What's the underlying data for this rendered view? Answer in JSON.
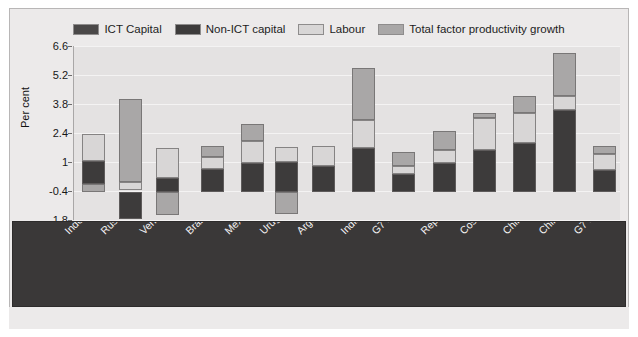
{
  "legend": {
    "items": [
      {
        "label": "ICT Capital",
        "color": "#4a4848",
        "icon": "legend-swatch-ict-capital"
      },
      {
        "label": "Non-ICT capital",
        "color": "#3d3b3b",
        "icon": "legend-swatch-non-ict-capital"
      },
      {
        "label": "Labour",
        "color": "#d8d6d6",
        "icon": "legend-swatch-labour"
      },
      {
        "label": "Total factor productivity growth",
        "color": "#a9a7a7",
        "icon": "legend-swatch-tfp"
      }
    ]
  },
  "axis": {
    "y_title": "Per cent",
    "y_ticks": [
      "6.6",
      "5.2",
      "3.8",
      "2.4",
      "1",
      "-0.4",
      "-1.8"
    ]
  },
  "chart_data": {
    "type": "bar",
    "title": "",
    "subtitle": "",
    "xlabel": "",
    "ylabel": "Per cent",
    "ylim": [
      -1.8,
      6.6
    ],
    "ytick_values": [
      6.6,
      5.2,
      3.8,
      2.4,
      1.0,
      -0.4,
      -1.8
    ],
    "grid": true,
    "stacked": true,
    "legend_position": "top-center",
    "categories": [
      "Indonesia a,I",
      "Russian Federation a,I",
      "Venezuela c,IV",
      "Brazil b,II",
      "Mexico a,I",
      "Uruguay b,II",
      "Argentina b,III",
      "India a,I",
      "G7 average (1989-1995) a",
      "Rep of Korea a,I",
      "Costa Rica b,IV",
      "Chile b,IV",
      "China  a,I",
      "G7 average (1999-2003) a"
    ],
    "series": [
      {
        "name": "ICT Capital",
        "color": "#4a4848",
        "values": [
          0.15,
          0.15,
          0.1,
          0.15,
          0.2,
          0.15,
          0.15,
          0.2,
          0.35,
          0.55,
          0.35,
          0.4,
          0.3,
          0.3
        ]
      },
      {
        "name": "Non-ICT capital",
        "color": "#3d3b3b",
        "values": [
          1.2,
          -1.45,
          0.35,
          1.05,
          1.3,
          1.45,
          1.2,
          2.1,
          0.85,
          1.6,
          1.9,
          2.25,
          3.6,
          0.85
        ]
      },
      {
        "name": "Labour",
        "color": "#d8d6d6",
        "values": [
          1.4,
          0.35,
          1.85,
          0.6,
          1.15,
          0.5,
          0.55,
          1.45,
          0.4,
          0.7,
          1.75,
          1.6,
          0.75,
          0.9
        ]
      },
      {
        "name": "Total factor productivity growth",
        "color": "#a9a7a7",
        "values": [
          -0.65,
          3.95,
          -1.95,
          0.6,
          0.05,
          -1.3,
          0.0,
          2.75,
          0.75,
          1.0,
          0.65,
          0.9,
          2.35,
          0.45
        ]
      }
    ]
  },
  "bars": [
    {
      "name": "Indonesia a,I",
      "x": 81,
      "width": 23,
      "segments": [
        {
          "series": "Total factor productivity growth",
          "top": 184,
          "bottom": 192,
          "color": "#a9a7a7"
        },
        {
          "series": "Non-ICT capital",
          "top": 161,
          "bottom": 184,
          "color": "#3d3b3b"
        },
        {
          "series": "Labour",
          "top": 134,
          "bottom": 161,
          "color": "#d8d6d6"
        }
      ]
    },
    {
      "name": "Russian Federation a,I",
      "x": 118,
      "width": 23,
      "segments": [
        {
          "series": "Non-ICT capital",
          "top": 192,
          "bottom": 219,
          "color": "#3d3b3b"
        },
        {
          "series": "Labour",
          "top": 182,
          "bottom": 190,
          "color": "#d8d6d6"
        },
        {
          "series": "Total factor productivity growth",
          "top": 99,
          "bottom": 182,
          "color": "#a9a7a7"
        }
      ]
    },
    {
      "name": "Venezuela c,IV",
      "x": 155,
      "width": 23,
      "segments": [
        {
          "series": "Total factor productivity growth",
          "top": 192,
          "bottom": 215,
          "color": "#a9a7a7"
        },
        {
          "series": "Non-ICT capital",
          "top": 178,
          "bottom": 192,
          "color": "#3d3b3b"
        },
        {
          "series": "Labour",
          "top": 148,
          "bottom": 178,
          "color": "#d8d6d6"
        }
      ]
    },
    {
      "name": "Brazil b,II",
      "x": 200,
      "width": 23,
      "segments": [
        {
          "series": "Non-ICT capital",
          "top": 169,
          "bottom": 192,
          "color": "#3d3b3b"
        },
        {
          "series": "Labour",
          "top": 157,
          "bottom": 169,
          "color": "#d8d6d6"
        },
        {
          "series": "Total factor productivity growth",
          "top": 146,
          "bottom": 157,
          "color": "#a9a7a7"
        }
      ]
    },
    {
      "name": "Mexico a,I",
      "x": 240,
      "width": 23,
      "segments": [
        {
          "series": "Non-ICT capital",
          "top": 163,
          "bottom": 192,
          "color": "#3d3b3b"
        },
        {
          "series": "Labour",
          "top": 141,
          "bottom": 163,
          "color": "#d8d6d6"
        },
        {
          "series": "Total factor productivity growth",
          "top": 124,
          "bottom": 141,
          "color": "#a9a7a7"
        }
      ]
    },
    {
      "name": "Uruguay b,II",
      "x": 274,
      "width": 23,
      "segments": [
        {
          "series": "Total factor productivity growth",
          "top": 192,
          "bottom": 214,
          "color": "#a9a7a7"
        },
        {
          "series": "Non-ICT capital",
          "top": 162,
          "bottom": 192,
          "color": "#3d3b3b"
        },
        {
          "series": "Labour",
          "top": 147,
          "bottom": 162,
          "color": "#d8d6d6"
        }
      ]
    },
    {
      "name": "Argentina b,III",
      "x": 311,
      "width": 23,
      "segments": [
        {
          "series": "Non-ICT capital",
          "top": 166,
          "bottom": 192,
          "color": "#3d3b3b"
        },
        {
          "series": "Labour",
          "top": 146,
          "bottom": 166,
          "color": "#d8d6d6"
        }
      ]
    },
    {
      "name": "India a,I",
      "x": 351,
      "width": 23,
      "segments": [
        {
          "series": "Non-ICT capital",
          "top": 148,
          "bottom": 192,
          "color": "#3d3b3b"
        },
        {
          "series": "Labour",
          "top": 120,
          "bottom": 148,
          "color": "#d8d6d6"
        },
        {
          "series": "Total factor productivity growth",
          "top": 68,
          "bottom": 120,
          "color": "#a9a7a7"
        }
      ]
    },
    {
      "name": "G7 average (1989-1995) a",
      "x": 391,
      "width": 23,
      "segments": [
        {
          "series": "Non-ICT capital",
          "top": 174,
          "bottom": 192,
          "color": "#3d3b3b"
        },
        {
          "series": "Labour",
          "top": 166,
          "bottom": 174,
          "color": "#d8d6d6"
        },
        {
          "series": "Total factor productivity growth",
          "top": 152,
          "bottom": 166,
          "color": "#a9a7a7"
        }
      ]
    },
    {
      "name": "Rep of Korea a,I",
      "x": 432,
      "width": 23,
      "segments": [
        {
          "series": "Non-ICT capital",
          "top": 163,
          "bottom": 192,
          "color": "#3d3b3b"
        },
        {
          "series": "Labour",
          "top": 150,
          "bottom": 163,
          "color": "#d8d6d6"
        },
        {
          "series": "Total factor productivity growth",
          "top": 131,
          "bottom": 150,
          "color": "#a9a7a7"
        }
      ]
    },
    {
      "name": "Costa Rica b,IV",
      "x": 472,
      "width": 23,
      "segments": [
        {
          "series": "Non-ICT capital",
          "top": 150,
          "bottom": 192,
          "color": "#3d3b3b"
        },
        {
          "series": "Labour",
          "top": 118,
          "bottom": 150,
          "color": "#d8d6d6"
        },
        {
          "series": "Total factor productivity growth",
          "top": 113,
          "bottom": 118,
          "color": "#a9a7a7"
        }
      ]
    },
    {
      "name": "Chile b,IV",
      "x": 512,
      "width": 23,
      "segments": [
        {
          "series": "Non-ICT capital",
          "top": 143,
          "bottom": 192,
          "color": "#3d3b3b"
        },
        {
          "series": "Labour",
          "top": 113,
          "bottom": 143,
          "color": "#d8d6d6"
        },
        {
          "series": "Total factor productivity growth",
          "top": 96,
          "bottom": 113,
          "color": "#a9a7a7"
        }
      ]
    },
    {
      "name": "China  a,I",
      "x": 552,
      "width": 23,
      "segments": [
        {
          "series": "Non-ICT capital",
          "top": 110,
          "bottom": 192,
          "color": "#3d3b3b"
        },
        {
          "series": "Labour",
          "top": 96,
          "bottom": 110,
          "color": "#d8d6d6"
        },
        {
          "series": "Total factor productivity growth",
          "top": 53,
          "bottom": 96,
          "color": "#a9a7a7"
        }
      ]
    },
    {
      "name": "G7 average (1999-2003) a",
      "x": 592,
      "width": 23,
      "segments": [
        {
          "series": "Non-ICT capital",
          "top": 170,
          "bottom": 192,
          "color": "#3d3b3b"
        },
        {
          "series": "Labour",
          "top": 154,
          "bottom": 170,
          "color": "#d8d6d6"
        },
        {
          "series": "Total factor productivity growth",
          "top": 146,
          "bottom": 154,
          "color": "#a9a7a7"
        }
      ]
    }
  ],
  "xlabels": [
    {
      "text": "Indonesia a,I",
      "x": 49
    },
    {
      "text": "Russian Federation a,I",
      "x": 85
    },
    {
      "text": "Venezuela c,IV",
      "x": 124
    },
    {
      "text": "Brazil b,II",
      "x": 170
    },
    {
      "text": "Mexico a,I",
      "x": 209
    },
    {
      "text": "Uruguay b,II",
      "x": 244
    },
    {
      "text": "Argentina b,III",
      "x": 281
    },
    {
      "text": "India a,I",
      "x": 325
    },
    {
      "text": "G7 average (1989-1995) a",
      "x": 356
    },
    {
      "text": "Rep of Korea a,I",
      "x": 405
    },
    {
      "text": "Costa Rica b,IV",
      "x": 444
    },
    {
      "text": "Chile b,IV",
      "x": 487
    },
    {
      "text": "China  a,I",
      "x": 523
    },
    {
      "text": "G7 average (1999-2003) a",
      "x": 558
    }
  ]
}
